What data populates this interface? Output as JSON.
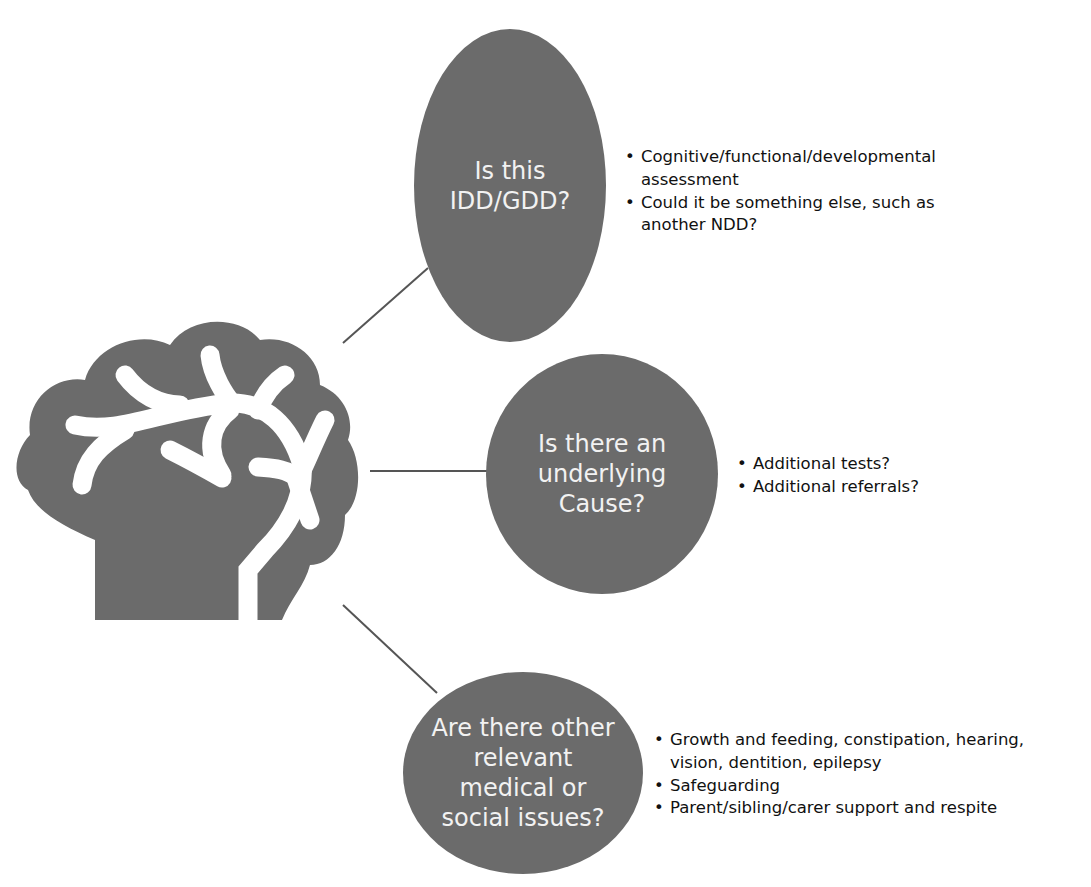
{
  "diagram": {
    "colors": {
      "bubble_fill": "#6b6b6b",
      "bubble_text": "#f2f2f2",
      "connector": "#555555",
      "brain": "#6b6b6b",
      "text": "#111111"
    },
    "central_icon": "brain-icon",
    "nodes": [
      {
        "id": "idd-gdd",
        "question_lines": [
          "Is this",
          "IDD/GDD?"
        ],
        "bullets": [
          "Cognitive/functional/developmental assessment",
          "Could it be something else,  such as another NDD?"
        ]
      },
      {
        "id": "underlying-cause",
        "question_lines": [
          "Is there an",
          "underlying",
          "Cause?"
        ],
        "bullets": [
          "Additional tests?",
          "Additional referrals?"
        ]
      },
      {
        "id": "other-issues",
        "question_lines": [
          "Are there other",
          "relevant",
          "medical or",
          "social issues?"
        ],
        "bullets": [
          "Growth and feeding, constipation, hearing, vision, dentition, epilepsy",
          "Safeguarding",
          "Parent/sibling/carer support and respite"
        ]
      }
    ]
  }
}
